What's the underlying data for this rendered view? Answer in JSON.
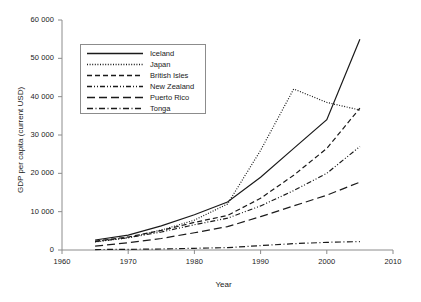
{
  "chart_data": {
    "type": "line",
    "title": "",
    "xlabel": "Year",
    "ylabel": "GDP per capita (current USD)",
    "xlim": [
      1960,
      2010
    ],
    "ylim": [
      0,
      60000
    ],
    "xticks": [
      1960,
      1970,
      1980,
      1990,
      2000,
      2010
    ],
    "xtick_labels": [
      "1960",
      "1970",
      "1980",
      "1990",
      "2000",
      "2010"
    ],
    "yticks": [
      0,
      10000,
      20000,
      30000,
      40000,
      50000,
      60000
    ],
    "ytick_labels": [
      "0",
      "10 000",
      "20 000",
      "30 000",
      "40 000",
      "50 000",
      "60 000"
    ],
    "grid": false,
    "legend_position": "upper left",
    "x": [
      1965,
      1970,
      1975,
      1980,
      1985,
      1990,
      1995,
      2000,
      2005
    ],
    "series": [
      {
        "name": "Iceland",
        "style": "solid",
        "color": "#1a1a1a",
        "values": [
          2600,
          3900,
          6300,
          9200,
          12500,
          19000,
          26500,
          34000,
          55000
        ]
      },
      {
        "name": "Japan",
        "style": "dotted",
        "color": "#1a1a1a",
        "values": [
          2100,
          3200,
          5200,
          7800,
          12000,
          26000,
          42000,
          38500,
          36500
        ]
      },
      {
        "name": "British Isles",
        "style": "dashed",
        "color": "#1a1a1a",
        "values": [
          2300,
          3400,
          5100,
          7200,
          9000,
          13500,
          19500,
          26500,
          37000
        ]
      },
      {
        "name": "New Zealand",
        "style": "dashdotdot",
        "color": "#1a1a1a",
        "values": [
          2200,
          3200,
          4700,
          6600,
          8300,
          11500,
          15500,
          20000,
          27000
        ]
      },
      {
        "name": "Puerto Rico",
        "style": "longdash",
        "color": "#1a1a1a",
        "values": [
          1000,
          1900,
          3000,
          4500,
          6100,
          8700,
          11500,
          14300,
          17700
        ]
      },
      {
        "name": "Tonga",
        "style": "dashdot",
        "color": "#1a1a1a",
        "values": [
          120,
          170,
          260,
          450,
          620,
          1150,
          1650,
          2000,
          2200
        ]
      }
    ]
  },
  "legend": {
    "items": [
      {
        "label": "Iceland"
      },
      {
        "label": "Japan"
      },
      {
        "label": "British Isles"
      },
      {
        "label": "New Zealand"
      },
      {
        "label": "Puerto Rico"
      },
      {
        "label": "Tonga"
      }
    ]
  }
}
